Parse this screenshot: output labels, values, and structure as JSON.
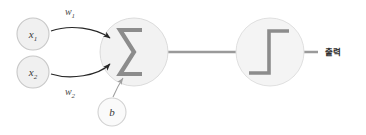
{
  "diagram": {
    "colors": {
      "background": "#ffffff",
      "node_fill": "#f0f0f0",
      "node_stroke": "#c8c8c8",
      "bias_fill": "#fafafa",
      "bias_stroke": "#d2d2d2",
      "connector_line": "#9a9a9a",
      "glyph": "#8c8c8c",
      "arrow": "#262626",
      "text": "#333333"
    },
    "inputs": [
      {
        "id": "x1",
        "label": "x",
        "subscript": "1",
        "cx": 33,
        "cy": 34,
        "r": 16
      },
      {
        "id": "x2",
        "label": "x",
        "subscript": "2",
        "cx": 33,
        "cy": 72,
        "r": 16
      }
    ],
    "weights": [
      {
        "id": "w1",
        "label": "w",
        "subscript": "1",
        "x": 70,
        "y": 15
      },
      {
        "id": "w2",
        "label": "w",
        "subscript": "2",
        "x": 70,
        "y": 95
      }
    ],
    "bias": {
      "id": "b",
      "label": "b",
      "cx": 112,
      "cy": 112,
      "r": 14
    },
    "sum_node": {
      "id": "sum",
      "glyph": "sigma",
      "cx": 134,
      "cy": 52,
      "r": 34
    },
    "activation_node": {
      "id": "activation",
      "glyph": "step-function",
      "cx": 270,
      "cy": 52,
      "r": 34
    },
    "output": {
      "id": "output",
      "label": "출력",
      "x": 325,
      "y": 55
    },
    "connector": {
      "from_x": 100,
      "to_x": 318,
      "y": 52
    }
  }
}
